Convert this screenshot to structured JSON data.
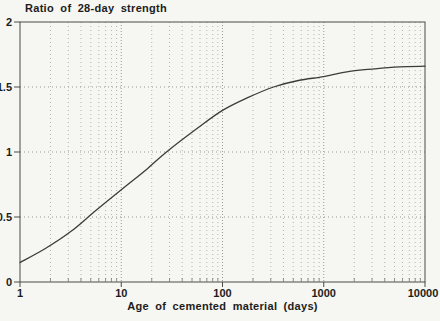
{
  "chart_data": {
    "type": "line",
    "title": "Ratio of 28-day strength",
    "xlabel": "Age of cemented material (days)",
    "ylabel": "Ratio of 28-day strength",
    "x_scale": "log",
    "xlim": [
      1,
      10000
    ],
    "ylim": [
      0,
      2
    ],
    "x_ticks": [
      1,
      10,
      100,
      1000,
      10000
    ],
    "x_tick_labels": [
      "1",
      "10",
      "100",
      "1000",
      "10000"
    ],
    "x_minor_multiples": [
      2,
      3,
      4,
      5,
      6,
      7,
      8,
      9
    ],
    "y_ticks": [
      0,
      0.5,
      1,
      1.5,
      2
    ],
    "y_tick_labels": [
      "0",
      "0.5",
      "1",
      "1.5",
      "2"
    ],
    "y_gridlines": [
      0.5,
      1,
      1.5
    ],
    "grid": "dotted",
    "legend": "none",
    "series": [
      {
        "name": "strength-ratio-curve",
        "points": [
          [
            1,
            0.15
          ],
          [
            1.8,
            0.26
          ],
          [
            3.2,
            0.39
          ],
          [
            5.6,
            0.55
          ],
          [
            10,
            0.71
          ],
          [
            18,
            0.87
          ],
          [
            28,
            1.0
          ],
          [
            56,
            1.18
          ],
          [
            100,
            1.32
          ],
          [
            180,
            1.42
          ],
          [
            320,
            1.5
          ],
          [
            560,
            1.55
          ],
          [
            1000,
            1.58
          ],
          [
            1800,
            1.62
          ],
          [
            3200,
            1.64
          ],
          [
            5600,
            1.655
          ],
          [
            10000,
            1.66
          ]
        ]
      }
    ]
  },
  "colors": {
    "background": "#f6f6f2",
    "axis": "#4a4a48",
    "curve": "#3c3c3a",
    "grid_minor": "#b4b4ae",
    "grid_major": "#9a9a94",
    "text": "#1c1c1c"
  }
}
